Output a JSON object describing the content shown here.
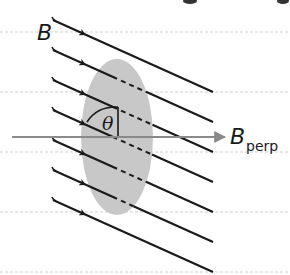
{
  "diagram": {
    "labels": {
      "field": "B",
      "angle": "θ",
      "perp_main": "B",
      "perp_sub": "perp"
    },
    "colors": {
      "background": "#ffffff",
      "field_line": "#1a1a1a",
      "surface": "#c8c8c8",
      "perp_arrow": "#8a8a8a",
      "ruled_line": "#cfcfcf"
    },
    "surface": {
      "shape": "ellipse",
      "cx": 117,
      "cy": 137,
      "rx": 36,
      "ry": 78
    },
    "field_lines": {
      "count": 7,
      "direction": "down-right",
      "start_x": 53,
      "end_x": 213,
      "slope": 0.45,
      "start_ys": [
        20,
        50,
        80,
        110,
        140,
        170,
        200
      ],
      "dashed_inside_surface": true
    },
    "perp_arrow": {
      "x1": 12,
      "y1": 137,
      "x2": 225,
      "y2": 137
    },
    "ruled_lines_y": [
      32,
      92,
      152,
      212,
      272
    ]
  }
}
